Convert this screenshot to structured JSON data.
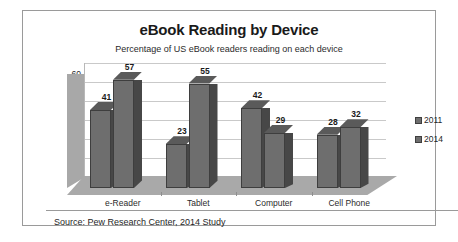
{
  "chart_data": {
    "type": "bar",
    "title": "eBook Reading by Device",
    "subtitle": "Percentage of US eBook readers reading on each device",
    "categories": [
      "e-Reader",
      "Tablet",
      "Computer",
      "Cell Phone"
    ],
    "series": [
      {
        "name": "2011",
        "values": [
          41,
          23,
          42,
          28
        ],
        "color": "#6e6e6e"
      },
      {
        "name": "2014",
        "values": [
          57,
          55,
          29,
          32
        ],
        "color": "#6e6e6e"
      }
    ],
    "xlabel": "",
    "ylabel": "",
    "ylim": [
      0,
      60
    ],
    "yticks": [
      0,
      10,
      20,
      30,
      40,
      50,
      60
    ],
    "grid": true,
    "legend_position": "right",
    "three_d": true,
    "source": "Source: Pew Research Center, 2014 Study"
  },
  "legend": {
    "items": [
      {
        "label": "2011"
      },
      {
        "label": "2014"
      }
    ]
  }
}
